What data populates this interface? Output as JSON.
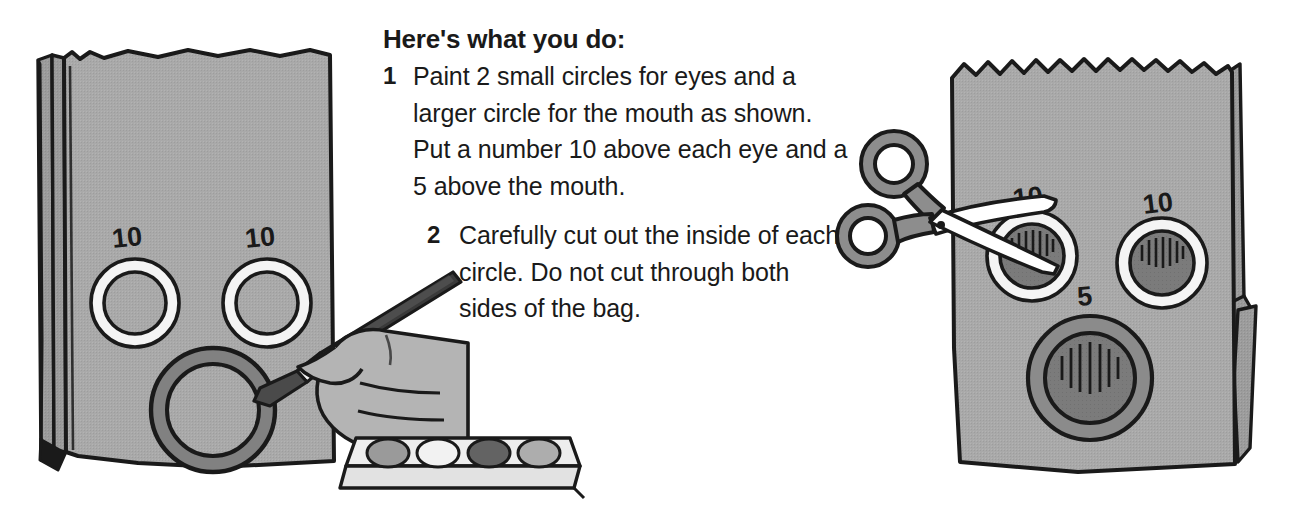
{
  "instructions": {
    "heading": "Here's what you do:",
    "steps": [
      {
        "number": "1",
        "text": "Paint 2 small circles for eyes and a larger circle for the mouth as shown. Put a number 10 above each eye and a 5 above the mouth."
      },
      {
        "number": "2",
        "text": "Carefully cut out the inside of each circle. Do not cut through both sides of the bag."
      }
    ]
  },
  "left_illustration": {
    "name": "paper-bag-being-painted",
    "bag_labels": {
      "left_eye": "10",
      "right_eye": "10"
    },
    "tools": [
      "paintbrush",
      "hand",
      "paint-tray"
    ],
    "paint_tray_wells": [
      "#9a9a9a",
      "#f2f2f2",
      "#636363",
      "#adadad"
    ]
  },
  "right_illustration": {
    "name": "paper-bag-being-cut",
    "bag_labels": {
      "left_eye": "10",
      "right_eye": "10",
      "mouth": "5"
    },
    "tools": [
      "scissors"
    ]
  },
  "colors": {
    "ink": "#1a1a1a",
    "bag_fill": "#a8a8a8",
    "bag_shade": "#9a9a9a",
    "ring_white": "#f4f4f4",
    "ring_dark": "#7d7d7d",
    "hole_fill": "#787878",
    "page_background": "#ffffff"
  }
}
